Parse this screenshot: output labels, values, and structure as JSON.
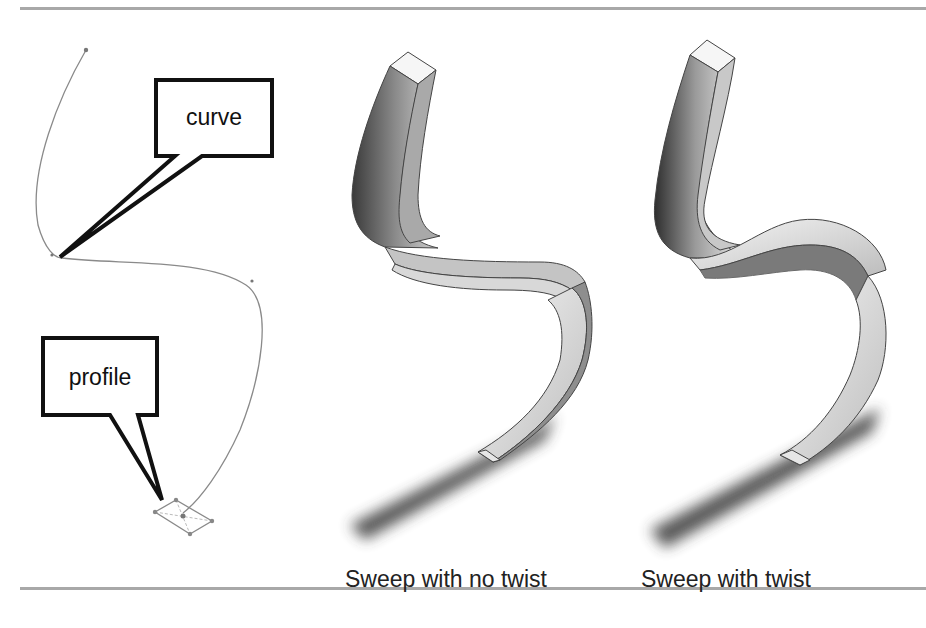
{
  "figure": {
    "callouts": {
      "curve": "curve",
      "profile": "profile"
    },
    "captions": {
      "no_twist": "Sweep with no twist",
      "twist": "Sweep with twist"
    },
    "colors": {
      "rule": "#a8a8a8",
      "path_line": "#8a8a8a",
      "callout_border": "#111111",
      "text": "#222222"
    }
  }
}
